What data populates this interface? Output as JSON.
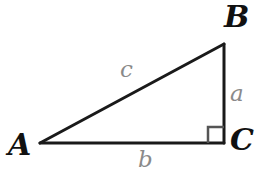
{
  "figure": {
    "background_color": "#ffffff",
    "stroke_color": "#1a1a1a",
    "label_color": "#111111",
    "side_label_color": "#8a8a8a",
    "right_angle_color": "#555555",
    "width": 264,
    "height": 178
  },
  "vertices": [
    {
      "name": "A",
      "label": "A",
      "x": 40,
      "y": 143
    },
    {
      "name": "B",
      "label": "B",
      "x": 224,
      "y": 44
    },
    {
      "name": "C",
      "label": "C",
      "x": 224,
      "y": 143
    }
  ],
  "sides": [
    {
      "name": "a",
      "label": "a",
      "between": "B-C",
      "orientation": "vertical"
    },
    {
      "name": "b",
      "label": "b",
      "between": "A-C",
      "orientation": "horizontal"
    },
    {
      "name": "c",
      "label": "c",
      "between": "A-B",
      "orientation": "hypotenuse"
    }
  ],
  "right_angle": {
    "at_vertex": "C",
    "marker": "square",
    "size": 16
  }
}
